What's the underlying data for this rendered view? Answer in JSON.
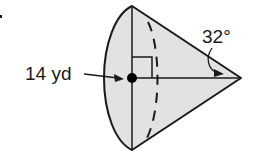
{
  "figure": {
    "type": "cone",
    "radius_label": "14 yd",
    "angle_label": "32°",
    "fill_color": "#e2e2e2",
    "stroke_color": "#1a1a1a"
  }
}
